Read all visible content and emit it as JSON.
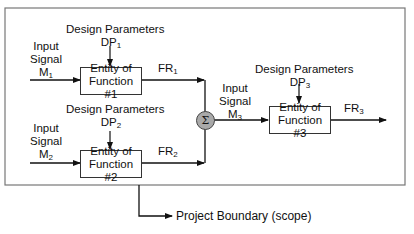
{
  "diagram": {
    "boundary_label": "Project Boundary (scope)",
    "entities": [
      {
        "line1": "Entity of",
        "line2": "Function #1"
      },
      {
        "line1": "Entity of",
        "line2": "Function #2"
      },
      {
        "line1": "Entity of",
        "line2": "Function #3"
      }
    ],
    "design_params": [
      {
        "title": "Design Parameters",
        "sym": "DP",
        "sub": "1"
      },
      {
        "title": "Design Parameters",
        "sym": "DP",
        "sub": "2"
      },
      {
        "title": "Design Parameters",
        "sym": "DP",
        "sub": "3"
      }
    ],
    "inputs": [
      {
        "l1": "Input",
        "l2": "Signal",
        "sym": "M",
        "sub": "1"
      },
      {
        "l1": "Input",
        "l2": "Signal",
        "sym": "M",
        "sub": "2"
      },
      {
        "l1": "Input",
        "l2": "Signal",
        "sym": "M",
        "sub": "3"
      }
    ],
    "outputs": [
      {
        "sym": "FR",
        "sub": "1"
      },
      {
        "sym": "FR",
        "sub": "2"
      },
      {
        "sym": "FR",
        "sub": "3"
      }
    ],
    "summation_symbol": "Σ"
  }
}
